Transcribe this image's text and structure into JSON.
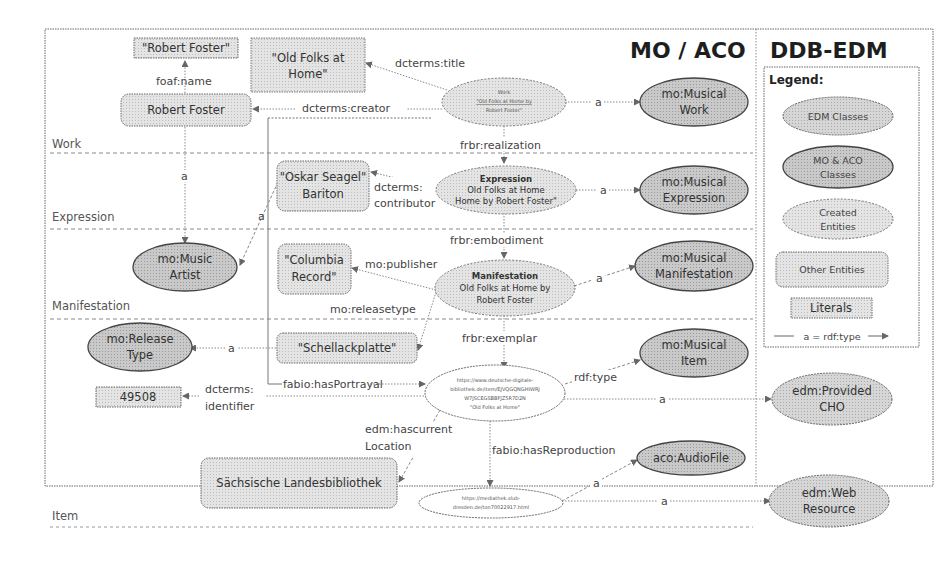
{
  "titles": {
    "mo_aco": "MO / ACO",
    "ddb_edm": "DDB-EDM"
  },
  "lanes": [
    {
      "label": "Work"
    },
    {
      "label": "Expression"
    },
    {
      "label": "Manifestation"
    },
    {
      "label": "Item"
    }
  ],
  "nodes": {
    "lit_robert_foster": "\"Robert Foster\"",
    "lit_old_folks": [
      "\"Old Folks at",
      "Home\""
    ],
    "robert_foster": "Robert Foster",
    "work": [
      "Work",
      "\"Old Folks at Home by",
      "Robert Foster\""
    ],
    "mo_musical_work": [
      "mo:Musical",
      "Work"
    ],
    "oskar_seagel": [
      "\"Oskar Seagel\"",
      "Bariton"
    ],
    "expression": [
      "Expression",
      "Old Folks at Home",
      "Home by Robert Foster\""
    ],
    "mo_musical_expression": [
      "mo:Musical",
      "Expression"
    ],
    "mo_music_artist": [
      "mo:Music",
      "Artist"
    ],
    "columbia_record": [
      "\"Columbia",
      "Record\""
    ],
    "manifestation": [
      "Manifestation",
      "Old Folks at Home by",
      "Robert Foster"
    ],
    "mo_musical_manifestation": [
      "mo:Musical",
      "Manifestation"
    ],
    "mo_release_type": [
      "mo:Release",
      "Type"
    ],
    "schellackplatte": "\"Schellackplatte\"",
    "lit_49508": "49508",
    "item": [
      "https://www.deutsche-digitale-",
      "bibliothek.de/item/EJVQGQNGHIWRJ",
      "W7JSCEGSBBFJZ5R7D2N",
      "\"Old Folks at Home\""
    ],
    "mo_musical_item": [
      "mo:Musical",
      "Item"
    ],
    "edm_provided_cho": [
      "edm:Provided",
      "CHO"
    ],
    "slub": "Sächsische Landesbibliothek",
    "aco_audiofile": "aco:AudioFile",
    "web_resource_url": [
      "https://mediathek.slub-",
      "dresden.de/ton70022917.html"
    ],
    "edm_web_resource": [
      "edm:Web",
      "Resource"
    ]
  },
  "edges": {
    "foaf_name": "foaf:name",
    "dcterms_title": "dcterms:title",
    "dcterms_creator": "dcterms:creator",
    "a_work": "a",
    "frbr_realization": "frbr:realization",
    "a_artist_1": "a",
    "a_artist_2": "a",
    "dcterms_contributor": [
      "dcterms:",
      "contributor"
    ],
    "a_expression": "a",
    "frbr_embodiment": "frbr:embodiment",
    "mo_publisher": "mo:publisher",
    "mo_releasetype": "mo:releasetype",
    "a_manifestation": "a",
    "a_releasetype": "a",
    "frbr_exemplar": "frbr:exemplar",
    "fabio_hasportrayal": "fabio:hasPortrayal",
    "dcterms_identifier": [
      "dcterms:",
      "identifier"
    ],
    "rdf_type": "rdf:type",
    "a_cho": "a",
    "edm_hascurrentlocation": [
      "edm:hascurrent",
      "Location"
    ],
    "fabio_hasreproduction": "fabio:hasReproduction",
    "a_audiofile": "a",
    "a_webresource": "a"
  },
  "legend": {
    "title": "Legend:",
    "edm_classes": "EDM Classes",
    "mo_aco_classes": [
      "MO & ACO",
      "Classes"
    ],
    "created_entities": [
      "Created",
      "Entities"
    ],
    "other_entities": "Other Entities",
    "literals": "Literals",
    "rdf_type": "a = rdf:type"
  },
  "colors": {
    "fill_light": "#e2e2e2",
    "fill_mid": "#cfcfcf",
    "fill_dark": "#b9b9b9",
    "stroke": "#555555",
    "line": "#777777"
  }
}
